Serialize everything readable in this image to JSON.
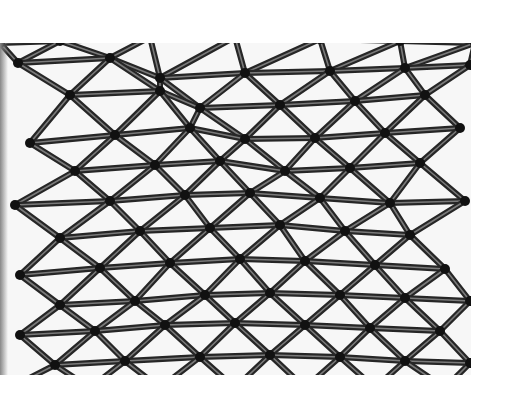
{
  "image": {
    "alt": "Triangulated steel lattice glass roof viewed from below",
    "colors": {
      "background": "#ffffff",
      "glass": "#f7f7f7",
      "strut": "#262626",
      "highlight": "#7a7a7a",
      "node": "#111111"
    },
    "region": {
      "x": 0,
      "y": 43,
      "width": 471,
      "height": 332
    }
  },
  "mesh": {
    "rows": [
      [
        [
          0,
          0
        ],
        [
          60,
          -2
        ],
        [
          150,
          -6
        ],
        [
          235,
          -6
        ],
        [
          320,
          -4
        ],
        [
          400,
          -2
        ],
        [
          475,
          0
        ]
      ],
      [
        [
          18,
          20
        ],
        [
          110,
          15
        ],
        [
          160,
          35
        ],
        [
          245,
          30
        ],
        [
          330,
          28
        ],
        [
          405,
          25
        ],
        [
          470,
          22
        ]
      ],
      [
        [
          70,
          52
        ],
        [
          160,
          48
        ],
        [
          200,
          65
        ],
        [
          280,
          62
        ],
        [
          355,
          58
        ],
        [
          425,
          52
        ]
      ],
      [
        [
          30,
          100
        ],
        [
          115,
          92
        ],
        [
          190,
          85
        ],
        [
          245,
          96
        ],
        [
          315,
          95
        ],
        [
          385,
          90
        ],
        [
          460,
          85
        ]
      ],
      [
        [
          75,
          128
        ],
        [
          155,
          122
        ],
        [
          220,
          118
        ],
        [
          285,
          128
        ],
        [
          350,
          125
        ],
        [
          420,
          120
        ]
      ],
      [
        [
          15,
          162
        ],
        [
          110,
          158
        ],
        [
          185,
          152
        ],
        [
          250,
          150
        ],
        [
          320,
          155
        ],
        [
          390,
          160
        ],
        [
          465,
          158
        ]
      ],
      [
        [
          60,
          195
        ],
        [
          140,
          188
        ],
        [
          210,
          185
        ],
        [
          280,
          182
        ],
        [
          345,
          188
        ],
        [
          410,
          192
        ]
      ],
      [
        [
          20,
          232
        ],
        [
          100,
          225
        ],
        [
          170,
          220
        ],
        [
          240,
          216
        ],
        [
          305,
          218
        ],
        [
          375,
          222
        ],
        [
          445,
          226
        ]
      ],
      [
        [
          60,
          262
        ],
        [
          135,
          258
        ],
        [
          205,
          252
        ],
        [
          270,
          250
        ],
        [
          340,
          252
        ],
        [
          405,
          255
        ],
        [
          470,
          258
        ]
      ],
      [
        [
          20,
          292
        ],
        [
          95,
          288
        ],
        [
          165,
          282
        ],
        [
          235,
          280
        ],
        [
          305,
          282
        ],
        [
          370,
          285
        ],
        [
          440,
          288
        ]
      ],
      [
        [
          55,
          322
        ],
        [
          125,
          318
        ],
        [
          200,
          314
        ],
        [
          270,
          312
        ],
        [
          340,
          314
        ],
        [
          405,
          318
        ],
        [
          470,
          320
        ]
      ],
      [
        [
          10,
          345
        ],
        [
          90,
          345
        ],
        [
          160,
          345
        ],
        [
          235,
          345
        ],
        [
          305,
          345
        ],
        [
          375,
          345
        ],
        [
          445,
          345
        ]
      ]
    ]
  }
}
